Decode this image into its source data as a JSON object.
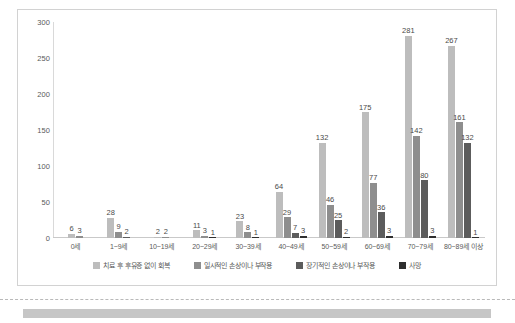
{
  "chart_data": {
    "type": "bar",
    "title": "",
    "xlabel": "",
    "ylabel": "",
    "ylim": [
      0,
      300
    ],
    "yticks": [
      "0",
      "50",
      "100",
      "150",
      "200",
      "250",
      "300"
    ],
    "grid": false,
    "legend_position": "bottom",
    "categories": [
      "0세",
      "1~9세",
      "10~19세",
      "20~29세",
      "30~39세",
      "40~49세",
      "50~59세",
      "60~69세",
      "70~79세",
      "80~89세 이상"
    ],
    "series": [
      {
        "name": "치료 후 후유증 없이 회복",
        "color": "#bdbdbd",
        "values": [
          6,
          28,
          2,
          11,
          23,
          64,
          132,
          175,
          281,
          267
        ]
      },
      {
        "name": "일시적인 손상이나 부작용",
        "color": "#8e8e8e",
        "values": [
          3,
          9,
          2,
          3,
          8,
          29,
          46,
          77,
          142,
          161
        ]
      },
      {
        "name": "장기적인 손상이나 부작용",
        "color": "#5c5c5c",
        "values": [
          0,
          2,
          0,
          0,
          0,
          7,
          25,
          36,
          80,
          132
        ]
      },
      {
        "name": "사망",
        "color": "#2e2e2e",
        "values": [
          0,
          0,
          0,
          1,
          1,
          3,
          2,
          3,
          3,
          1
        ]
      }
    ]
  }
}
